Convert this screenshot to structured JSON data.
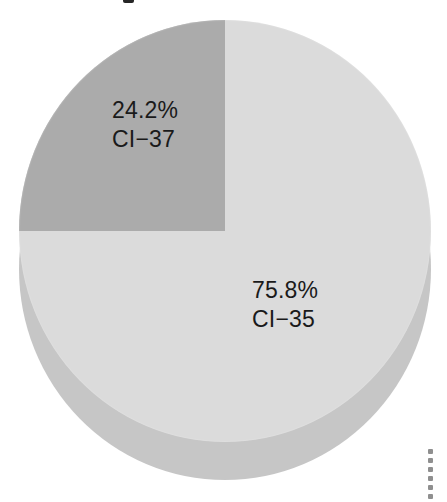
{
  "figure": {
    "background_color": "#ffffff",
    "title_fragment": "",
    "dotted_rule_dot_count": 7
  },
  "chart_data": {
    "type": "pie",
    "title": "",
    "xlabel": "",
    "ylabel": "",
    "style": "3d-disc",
    "legend_position": "none",
    "grid": false,
    "categories": [
      "CI−35",
      "CI−37"
    ],
    "values": [
      75.8,
      24.2
    ],
    "value_unit": "percent",
    "colors": [
      "#dbdbdb",
      "#ababab"
    ],
    "side_wall_color": "#c6c6c6",
    "label_color": "#1a1a1a",
    "start_angle_deg": 90,
    "direction": "counterclockwise",
    "slices": [
      {
        "name": "CI−35",
        "percent_label": "75.8%",
        "category_label": "CI−35",
        "value": 75.8,
        "color": "#dbdbdb",
        "angle_deg": 272.9
      },
      {
        "name": "CI−37",
        "percent_label": "24.2%",
        "category_label": "CI−37",
        "value": 24.2,
        "color": "#ababab",
        "angle_deg": 87.1
      }
    ]
  }
}
